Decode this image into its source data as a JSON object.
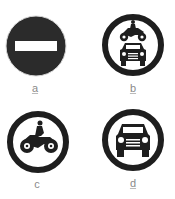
{
  "signs": [
    {
      "id": "a",
      "label": "a",
      "type": "no-entry",
      "fill": "#2b2b2b",
      "bar": "#ffffff"
    },
    {
      "id": "b",
      "label": "b",
      "type": "no-motor-vehicles",
      "ring": "#1e1e1e"
    },
    {
      "id": "c",
      "label": "c",
      "type": "no-motorcycles",
      "ring": "#1e1e1e"
    },
    {
      "id": "d",
      "label": "d",
      "type": "no-cars",
      "ring": "#1e1e1e"
    }
  ]
}
